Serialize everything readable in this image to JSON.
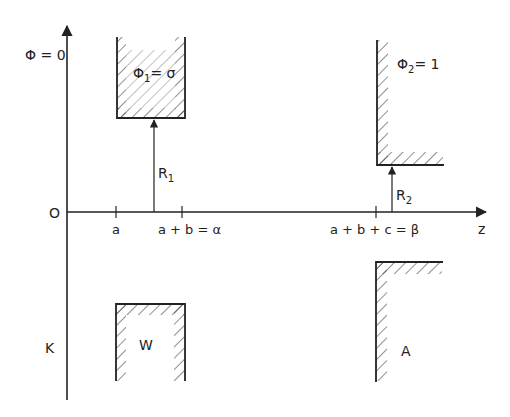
{
  "axes": {
    "vertical_label": "Φ = 0",
    "origin_label": "O",
    "horizontal_label": "z",
    "bottom_left_label": "K"
  },
  "ticks": [
    {
      "label": "a",
      "x": 116
    },
    {
      "label": "a + b = α",
      "x": 182
    },
    {
      "label": "a + b + c = β",
      "x": 376
    }
  ],
  "electrodes": {
    "upper_left": {
      "label_main": "Φ",
      "label_sub": "1",
      "label_rest": "= σ"
    },
    "upper_right": {
      "label_main": "Φ",
      "label_sub": "2",
      "label_rest": "= 1"
    },
    "lower_left": {
      "label": "W"
    },
    "lower_right": {
      "label": "A"
    }
  },
  "radii": {
    "r1": {
      "main": "R",
      "sub": "1"
    },
    "r2": {
      "main": "R",
      "sub": "2"
    }
  },
  "colors": {
    "ink": "#222222",
    "background": "#ffffff"
  }
}
